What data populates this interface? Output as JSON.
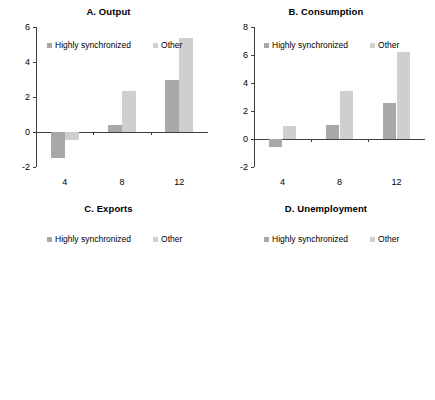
{
  "figure": {
    "series_names": [
      "Highly synchronized",
      "Other"
    ],
    "series_colors": [
      "#a8a8a8",
      "#cfcfcf"
    ],
    "axis_color": "#3f3f3f",
    "background": "#ffffff"
  },
  "chart_data": [
    {
      "type": "bar",
      "title": "A. Output",
      "categories": [
        "4",
        "8",
        "12"
      ],
      "series": [
        {
          "name": "Highly synchronized",
          "values": [
            -1.5,
            0.4,
            3.0
          ]
        },
        {
          "name": "Other",
          "values": [
            -0.45,
            2.35,
            5.35
          ]
        }
      ],
      "xlabel": "",
      "ylabel": "",
      "ylim": [
        -2,
        6
      ],
      "yticks": [
        -2,
        0,
        2,
        4,
        6
      ],
      "ytick_labels": [
        "-2",
        "0",
        "2",
        "4",
        "6"
      ],
      "grid": false,
      "legend_position": "top-inside"
    },
    {
      "type": "bar",
      "title": "B. Consumption",
      "categories": [
        "4",
        "8",
        "12"
      ],
      "series": [
        {
          "name": "Highly synchronized",
          "values": [
            -0.6,
            1.0,
            2.55
          ]
        },
        {
          "name": "Other",
          "values": [
            0.9,
            3.45,
            6.2
          ]
        }
      ],
      "xlabel": "",
      "ylabel": "",
      "ylim": [
        -2,
        8
      ],
      "yticks": [
        -2,
        0,
        2,
        4,
        6,
        8
      ],
      "ytick_labels": [
        "-2",
        "0",
        "2",
        "4",
        "6",
        "8"
      ],
      "grid": false,
      "legend_position": "top-inside"
    },
    {
      "type": "bar",
      "title": "C. Exports",
      "categories": [
        "4",
        "8",
        "12"
      ],
      "series": [
        {
          "name": "Highly synchronized",
          "values": [
            -1.5,
            4.0,
            9.7
          ]
        },
        {
          "name": "Other",
          "values": [
            2.15,
            8.85,
            15.2
          ]
        }
      ],
      "xlabel": "",
      "ylabel": "",
      "ylim": [
        -4,
        20
      ],
      "yticks": [
        -4,
        0,
        4,
        8,
        12,
        16,
        20
      ],
      "ytick_labels": [
        "-4",
        "0",
        "4",
        "8",
        "12",
        "16",
        "20"
      ],
      "grid": false,
      "legend_position": "top-inside"
    },
    {
      "type": "bar",
      "title": "D. Unemployment",
      "categories": [
        "4",
        "8",
        "12"
      ],
      "series": [
        {
          "name": "Highly synchronized",
          "values": [
            0.95,
            1.8,
            2.1
          ]
        },
        {
          "name": "Other",
          "values": [
            0.69,
            0.9,
            0.9
          ]
        }
      ],
      "xlabel": "",
      "ylabel": "",
      "ylim": [
        0,
        2.5
      ],
      "yticks": [
        0,
        0.5,
        1,
        1.5,
        2,
        2.5
      ],
      "ytick_labels": [
        "0",
        "0.5",
        "1",
        "1.5",
        "2",
        "2.5"
      ],
      "grid": false,
      "legend_position": "top-inside"
    }
  ]
}
